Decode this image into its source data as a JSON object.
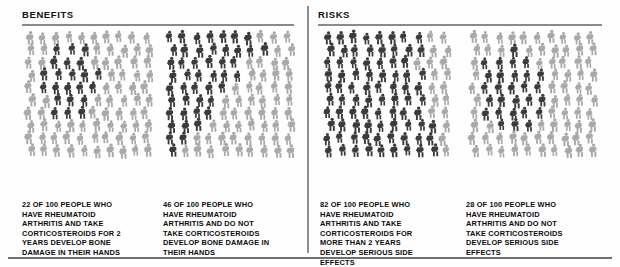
{
  "sections": [
    {
      "id": "benefits",
      "title": "BENEFITS"
    },
    {
      "id": "risks",
      "title": "RISKS"
    }
  ],
  "colors": {
    "highlight": "#3b3b3b",
    "background_figure": "#a9a9a9",
    "rule": "#8a8a8a",
    "text": "#0b0b0b"
  },
  "panels": [
    {
      "section": "benefits",
      "name": "corticosteroids-bone-damage",
      "count": 22,
      "total": 100,
      "caption_lines": [
        "22 OF 100 PEOPLE WHO",
        "HAVE RHEUMATOID",
        "ARTHRITIS AND TAKE",
        "CORTICOSTEROIDS FOR 2",
        "YEARS DEVELOP BONE",
        "DAMAGE IN THEIR HANDS"
      ]
    },
    {
      "section": "benefits",
      "name": "no-corticosteroids-bone-damage",
      "count": 46,
      "total": 100,
      "caption_lines": [
        "46 OF 100 PEOPLE WHO",
        "HAVE RHEUMATOID",
        "ARTHRITIS AND DO NOT",
        "TAKE CORTICOSTEROIDS",
        "DEVELOP BONE DAMAGE IN",
        "THEIR HANDS"
      ]
    },
    {
      "section": "risks",
      "name": "corticosteroids-side-effects",
      "count": 82,
      "total": 100,
      "caption_lines": [
        "82 OF 100 PEOPLE WHO",
        "HAVE RHEUMATOID",
        "ARTHRITIS AND TAKE",
        "CORTICOSTEROIDS FOR",
        "MORE THAN 2 YEARS",
        "DEVELOP SERIOUS SIDE",
        "EFFECTS"
      ]
    },
    {
      "section": "risks",
      "name": "no-corticosteroids-side-effects",
      "count": 28,
      "total": 100,
      "caption_lines": [
        "28 OF 100 PEOPLE WHO",
        "HAVE RHEUMATOID",
        "ARTHRITIS AND DO NOT",
        "TAKE CORTICOSTEROIDS",
        "DEVELOP SERIOUS SIDE",
        "EFFECTS"
      ]
    }
  ],
  "chart_data": {
    "type": "pictogram",
    "unit": "1 icon = 1 person",
    "total_per_panel": 100,
    "grid": {
      "rows": 10,
      "cols": 10
    },
    "categories": [
      "Take corticosteroids for 2 years - bone damage in hands",
      "Do not take corticosteroids - bone damage in hands",
      "Take corticosteroids more than 2 years - serious side effects",
      "Do not take corticosteroids - serious side effects"
    ],
    "values": [
      22,
      46,
      82,
      28
    ],
    "groups": [
      "BENEFITS",
      "BENEFITS",
      "RISKS",
      "RISKS"
    ],
    "legend": [
      {
        "label": "affected",
        "color": "#3b3b3b"
      },
      {
        "label": "not affected",
        "color": "#a9a9a9"
      }
    ]
  }
}
